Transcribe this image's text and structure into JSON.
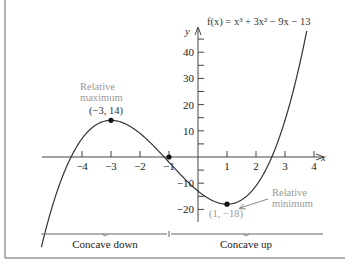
{
  "chart_data": {
    "type": "line",
    "title": "",
    "function_label": "f(x) = x³ + 3x² − 9x − 13",
    "coefficients": [
      1,
      3,
      -9,
      -13
    ],
    "xlabel": "x",
    "ylabel": "y",
    "xlim": [
      -5.4,
      4.3
    ],
    "ylim": [
      -25,
      52
    ],
    "curve_domain": [
      -5.4,
      3.75
    ],
    "x_ticks": [
      -4,
      -3,
      -2,
      -1,
      1,
      2,
      3,
      4
    ],
    "x_tick_labels": [
      "−4",
      "−3",
      "−2",
      "−1",
      "1",
      "2",
      "3",
      "4"
    ],
    "y_ticks": [
      -20,
      -15,
      -10,
      -5,
      5,
      10,
      15,
      20,
      25,
      30,
      35,
      40,
      45
    ],
    "y_labeled_ticks": [
      -20,
      -10,
      10,
      20,
      30,
      40
    ],
    "y_tick_labels": [
      "−20",
      "−10",
      "10",
      "20",
      "30",
      "40"
    ],
    "grid": false,
    "points": [
      {
        "name": "relative-maximum",
        "x": -3,
        "y": 14,
        "label": "(−3, 14)",
        "annotation": [
          "Relative",
          "maximum"
        ]
      },
      {
        "name": "inflection-point",
        "x": -1,
        "y": 0,
        "label": "",
        "annotation": []
      },
      {
        "name": "relative-minimum",
        "x": 1,
        "y": -18,
        "label": "(1, −18)",
        "annotation": [
          "Relative",
          "minimum"
        ]
      }
    ],
    "regions": [
      {
        "label": "Concave down",
        "from": -5.4,
        "to": -1
      },
      {
        "label": "Concave up",
        "from": -1,
        "to": 4.3
      }
    ]
  },
  "colors": {
    "curve": "#333333",
    "axis": "#444444",
    "annotation": "#9a9a9a",
    "frame": "#555555"
  }
}
